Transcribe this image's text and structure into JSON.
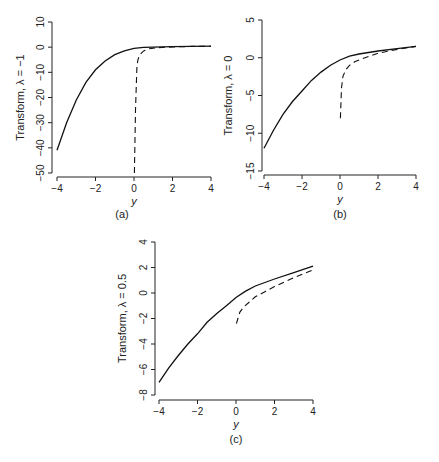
{
  "chart_data": [
    {
      "type": "line",
      "panel_label": "(a)",
      "title": "",
      "xlabel": "y",
      "ylabel": "Transform, λ = −1",
      "xlim": [
        -4,
        4
      ],
      "ylim": [
        -50,
        10
      ],
      "xticks": [
        "−4",
        "−2",
        "0",
        "2",
        "4"
      ],
      "yticks": [
        "10",
        "0",
        "−10",
        "−20",
        "−30",
        "−40",
        "−50"
      ],
      "grid": false,
      "series": [
        {
          "name": "solid",
          "style": "solid",
          "x": [
            -4,
            -3.5,
            -3,
            -2.5,
            -2,
            -1.5,
            -1,
            -0.5,
            0,
            0.5,
            1,
            2,
            3,
            4
          ],
          "y": [
            -41,
            -30,
            -21,
            -14,
            -9,
            -5.5,
            -3,
            -1.5,
            -0.5,
            -0.1,
            0,
            0.2,
            0.3,
            0.4
          ]
        },
        {
          "name": "dashed",
          "style": "dashed",
          "x": [
            0.02,
            0.08,
            0.15,
            0.2,
            0.3,
            0.5,
            0.8,
            1.2,
            2,
            3,
            4
          ],
          "y": [
            -50,
            -25,
            -8,
            -5,
            -3,
            -1.5,
            -0.6,
            -0.2,
            0.1,
            0.3,
            0.4
          ]
        }
      ]
    },
    {
      "type": "line",
      "panel_label": "(b)",
      "title": "",
      "xlabel": "y",
      "ylabel": "Transform, λ = 0",
      "xlim": [
        -4,
        4
      ],
      "ylim": [
        -15,
        5
      ],
      "xticks": [
        "−4",
        "−2",
        "0",
        "2",
        "4"
      ],
      "yticks": [
        "5",
        "0",
        "−5",
        "−10",
        "−15"
      ],
      "grid": false,
      "series": [
        {
          "name": "solid",
          "style": "solid",
          "x": [
            -4,
            -3.5,
            -3,
            -2.5,
            -2,
            -1.5,
            -1,
            -0.5,
            0,
            0.5,
            1,
            2,
            3,
            4
          ],
          "y": [
            -12,
            -9.6,
            -7.5,
            -5.8,
            -4.4,
            -3.0,
            -1.9,
            -1.0,
            -0.3,
            0.2,
            0.5,
            0.9,
            1.2,
            1.5
          ]
        },
        {
          "name": "dashed",
          "style": "dashed",
          "x": [
            0.02,
            0.08,
            0.15,
            0.3,
            0.5,
            0.8,
            1.2,
            2,
            3,
            4
          ],
          "y": [
            -8,
            -4,
            -2.5,
            -1.6,
            -1.0,
            -0.5,
            -0.1,
            0.6,
            1.1,
            1.5
          ]
        }
      ]
    },
    {
      "type": "line",
      "panel_label": "(c)",
      "title": "",
      "xlabel": "y",
      "ylabel": "Transform, λ = 0.5",
      "xlim": [
        -4,
        4
      ],
      "ylim": [
        -8,
        4
      ],
      "xticks": [
        "−4",
        "−2",
        "0",
        "2",
        "4"
      ],
      "yticks": [
        "4",
        "2",
        "0",
        "−2",
        "−4",
        "−6",
        "−8"
      ],
      "grid": false,
      "series": [
        {
          "name": "solid",
          "style": "solid",
          "x": [
            -4,
            -3.5,
            -3,
            -2.5,
            -2,
            -1.5,
            -1,
            -0.5,
            0,
            0.5,
            1,
            2,
            3,
            4
          ],
          "y": [
            -7.0,
            -5.9,
            -4.9,
            -4.0,
            -3.2,
            -2.3,
            -1.6,
            -1.0,
            -0.35,
            0.15,
            0.55,
            1.1,
            1.6,
            2.1
          ]
        },
        {
          "name": "dashed",
          "style": "dashed",
          "x": [
            0.02,
            0.1,
            0.2,
            0.4,
            0.7,
            1,
            1.5,
            2,
            3,
            4
          ],
          "y": [
            -2.4,
            -2.0,
            -1.5,
            -1.1,
            -0.7,
            -0.3,
            0.1,
            0.5,
            1.2,
            1.8
          ]
        }
      ]
    }
  ]
}
